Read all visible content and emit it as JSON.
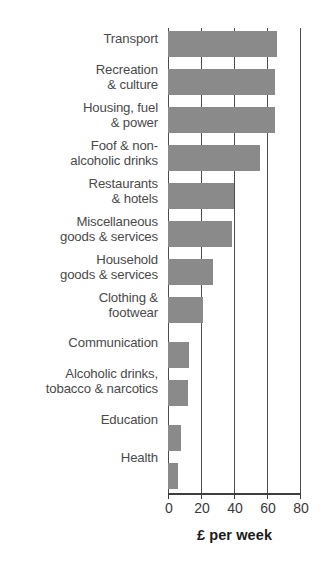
{
  "chart_data": {
    "type": "bar",
    "orientation": "horizontal",
    "title": "",
    "subtitle": "",
    "xlabel": "£ per week",
    "ylabel": "",
    "xlim": [
      0,
      80
    ],
    "xticks": [
      0,
      20,
      40,
      60,
      80
    ],
    "xticklabels": [
      "0",
      "20",
      "40",
      "60",
      "80"
    ],
    "grid": "vertical",
    "legend": "none",
    "bar_color": "#8a8a8a",
    "axis_color": "#4d4d4d",
    "label_color": "#4a4a4a",
    "categories": [
      "Transport",
      "Recreation\n& culture",
      "Housing, fuel\n& power",
      "Foof & non-\nalcoholic drinks",
      "Restaurants\n& hotels",
      "Miscellaneous\ngoods & services",
      "Household\ngoods & services",
      "Clothing &\nfootwear",
      "Communication",
      "Alcoholic drinks,\ntobacco & narcotics",
      "Education",
      "Health"
    ],
    "values": [
      66,
      65,
      65,
      56,
      40,
      39,
      27,
      21,
      13,
      12,
      8,
      6
    ],
    "series": [
      {
        "name": "Household expenditure",
        "values": [
          66,
          65,
          65,
          56,
          40,
          39,
          27,
          21,
          13,
          12,
          8,
          6
        ]
      }
    ]
  }
}
